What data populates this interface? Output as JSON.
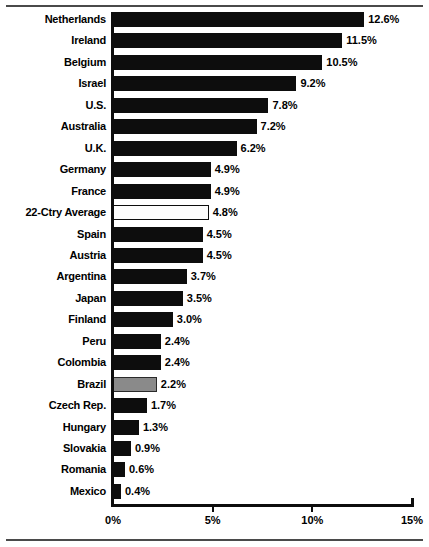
{
  "chart_data": {
    "type": "bar",
    "orientation": "horizontal",
    "title": "",
    "xlabel": "",
    "ylabel": "",
    "xlim": [
      0,
      15
    ],
    "xticks": [
      "0%",
      "5%",
      "10%",
      "15%"
    ],
    "xtick_values": [
      0,
      5,
      10,
      15
    ],
    "grid": false,
    "legend": false,
    "value_suffix": "%",
    "categories": [
      "Netherlands",
      "Ireland",
      "Belgium",
      "Israel",
      "U.S.",
      "Australia",
      "U.K.",
      "Germany",
      "France",
      "22-Ctry Average",
      "Spain",
      "Austria",
      "Argentina",
      "Japan",
      "Finland",
      "Peru",
      "Colombia",
      "Brazil",
      "Czech Rep.",
      "Hungary",
      "Slovakia",
      "Romania",
      "Mexico"
    ],
    "values": [
      12.6,
      11.5,
      10.5,
      9.2,
      7.8,
      7.2,
      6.2,
      4.9,
      4.9,
      4.8,
      4.5,
      4.5,
      3.7,
      3.5,
      3.0,
      2.4,
      2.4,
      2.2,
      1.7,
      1.3,
      0.9,
      0.6,
      0.4
    ],
    "value_labels": [
      "12.6%",
      "11.5%",
      "10.5%",
      "9.2%",
      "7.8%",
      "7.2%",
      "6.2%",
      "4.9%",
      "4.9%",
      "4.8%",
      "4.5%",
      "4.5%",
      "3.7%",
      "3.5%",
      "3.0%",
      "2.4%",
      "2.4%",
      "2.2%",
      "1.7%",
      "1.3%",
      "0.9%",
      "0.6%",
      "0.4%"
    ],
    "bar_styles": [
      "filled",
      "filled",
      "filled",
      "filled",
      "filled",
      "filled",
      "filled",
      "filled",
      "filled",
      "outline",
      "filled",
      "filled",
      "filled",
      "filled",
      "filled",
      "filled",
      "filled",
      "gray",
      "filled",
      "filled",
      "filled",
      "filled",
      "filled"
    ]
  },
  "colors": {
    "bar_filled": "#0d0d0d",
    "bar_outline_fill": "#fdfdfd",
    "bar_gray": "#8a8a8a",
    "axis": "#0d0d0d",
    "text": "#000000",
    "rule": "#4a4a4a",
    "background": "#ffffff"
  }
}
